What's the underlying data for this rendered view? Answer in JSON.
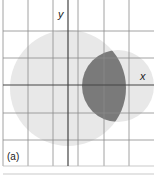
{
  "diagram": {
    "axis_labels": {
      "x": "x",
      "y": "y"
    },
    "panel_label": "(a)",
    "colors": {
      "grid": "#8a8a8a",
      "axis": "#444444",
      "large_circle": "#e8e8e8",
      "small_circle": "#e8e8e8",
      "intersection": "#7a7a7a"
    },
    "shapes": [
      {
        "name": "large-circle",
        "cx": 68,
        "cy": 88,
        "r": 58
      },
      {
        "name": "small-circle",
        "cx": 118,
        "cy": 86,
        "r": 36
      }
    ]
  }
}
